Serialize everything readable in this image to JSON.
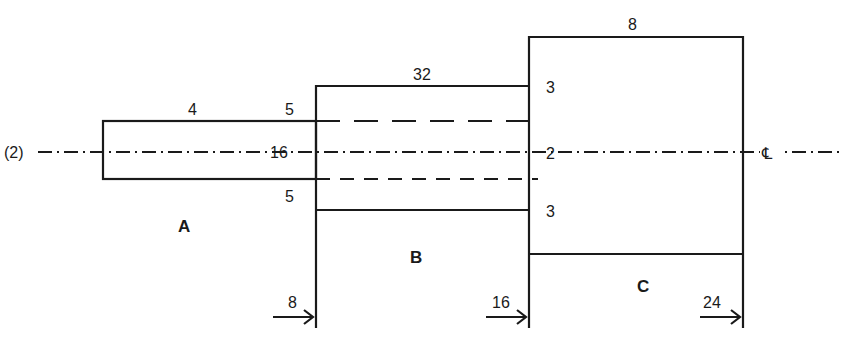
{
  "diagram": {
    "type": "stepped-shaft-cross-section",
    "centerline": {
      "left_label": "(2)",
      "right_symbol": "℄"
    },
    "sections": [
      {
        "id": "A",
        "label": "A",
        "length_label": "4",
        "inner_label": "16"
      },
      {
        "id": "B",
        "label": "B",
        "length_label": "32",
        "top_offset_label": "5",
        "bottom_offset_label": "5"
      },
      {
        "id": "C",
        "label": "C",
        "length_label": "8",
        "top_offset_label": "3",
        "center_label": "2",
        "bottom_offset_label": "3"
      }
    ],
    "position_markers": [
      {
        "label": "8"
      },
      {
        "label": "16"
      },
      {
        "label": "24"
      }
    ]
  }
}
